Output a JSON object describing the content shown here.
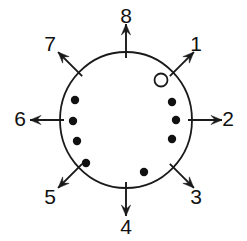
{
  "figure": {
    "background_color": "#ffffff",
    "stroke_color": "#1a1a1a",
    "marker_fill_color": "#111111",
    "open_marker_fill": "#ffffff",
    "width": 247,
    "height": 241
  },
  "circle": {
    "label": "main-circle",
    "center_x": 126,
    "center_y": 120,
    "radius_x": 66,
    "radius_y": 68,
    "stroke_width": 1.8,
    "fill": "none"
  },
  "directions": [
    {
      "label": "1",
      "angle_deg": 45,
      "label_x": 196,
      "label_y": 45,
      "arrow_start_r": 62,
      "arrow_end_r": 96
    },
    {
      "label": "2",
      "angle_deg": 0,
      "label_x": 228,
      "label_y": 120,
      "arrow_start_r": 62,
      "arrow_end_r": 96
    },
    {
      "label": "3",
      "angle_deg": -45,
      "label_x": 196,
      "label_y": 198,
      "arrow_start_r": 62,
      "arrow_end_r": 96
    },
    {
      "label": "4",
      "angle_deg": -90,
      "label_x": 126,
      "label_y": 228,
      "arrow_start_r": 62,
      "arrow_end_r": 96
    },
    {
      "label": "5",
      "angle_deg": -135,
      "label_x": 50,
      "label_y": 198,
      "arrow_start_r": 62,
      "arrow_end_r": 96
    },
    {
      "label": "6",
      "angle_deg": 180,
      "label_x": 20,
      "label_y": 120,
      "arrow_start_r": 62,
      "arrow_end_r": 96
    },
    {
      "label": "7",
      "angle_deg": 135,
      "label_x": 50,
      "label_y": 45,
      "arrow_start_r": 62,
      "arrow_end_r": 96
    },
    {
      "label": "8",
      "angle_deg": 90,
      "label_x": 126,
      "label_y": 17,
      "arrow_start_r": 62,
      "arrow_end_r": 96
    }
  ],
  "markers": {
    "filled_radius": 4.2,
    "open_radius": 6.5,
    "open_stroke_width": 1.8,
    "filled": [
      {
        "name": "dot-right-upper",
        "x": 172,
        "y": 102
      },
      {
        "name": "dot-right-middle",
        "x": 176,
        "y": 120
      },
      {
        "name": "dot-right-lower",
        "x": 172,
        "y": 139
      },
      {
        "name": "dot-bottom-right",
        "x": 144,
        "y": 172
      },
      {
        "name": "dot-bottom-left",
        "x": 86,
        "y": 163
      },
      {
        "name": "dot-left-lower",
        "x": 77,
        "y": 141
      },
      {
        "name": "dot-left-middle",
        "x": 73,
        "y": 121
      },
      {
        "name": "dot-left-upper",
        "x": 75,
        "y": 100
      }
    ],
    "open": [
      {
        "name": "open-marker-upper-right",
        "x": 161,
        "y": 80
      }
    ]
  }
}
